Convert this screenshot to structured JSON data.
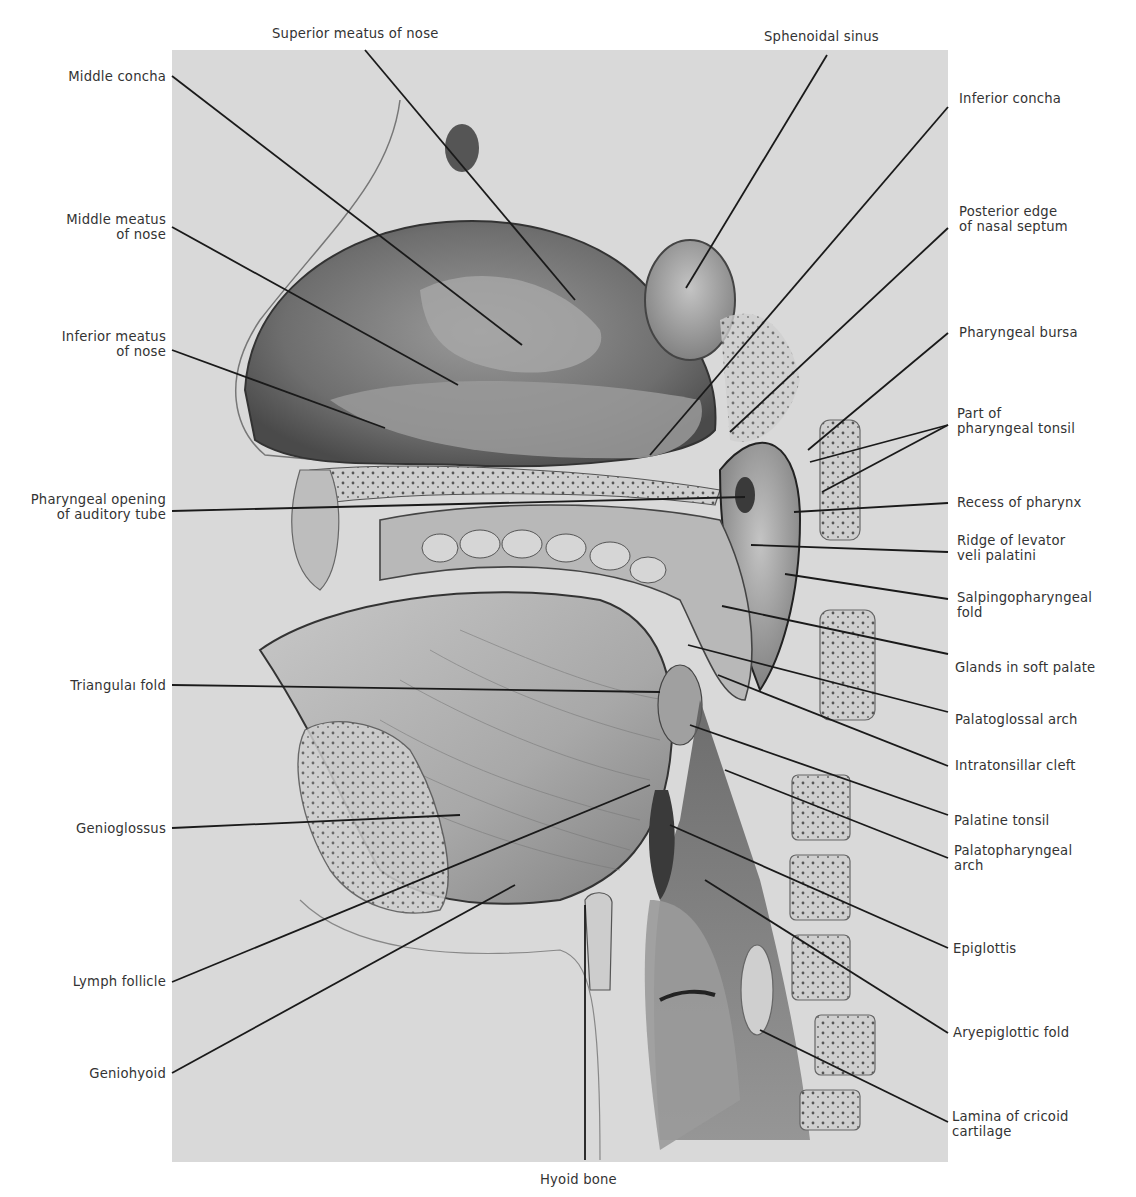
{
  "figure": {
    "colors": {
      "background": "#ffffff",
      "plate": "#d9d9d9",
      "ink": "#1a1a1a",
      "label": "#333333"
    }
  },
  "labels": {
    "top": [
      {
        "id": "superior-meatus",
        "lines": [
          "Superior meatus of nose"
        ]
      },
      {
        "id": "sphenoidal-sinus",
        "lines": [
          "Sphenoidal sinus"
        ]
      }
    ],
    "left": [
      {
        "id": "middle-concha",
        "lines": [
          "Middle concha"
        ]
      },
      {
        "id": "middle-meatus",
        "lines": [
          "Middle meatus",
          "of nose"
        ]
      },
      {
        "id": "inferior-meatus",
        "lines": [
          "Inferior meatus",
          "of nose"
        ]
      },
      {
        "id": "pharyngeal-opening",
        "lines": [
          "Pharyngeal opening",
          "of auditory tube"
        ]
      },
      {
        "id": "triangular-fold",
        "lines": [
          "Triangulaı fold"
        ]
      },
      {
        "id": "genioglossus",
        "lines": [
          "Genioglossus"
        ]
      },
      {
        "id": "lymph-follicle",
        "lines": [
          "Lymph follicle"
        ]
      },
      {
        "id": "geniohyoid",
        "lines": [
          "Geniohyoid"
        ]
      }
    ],
    "right": [
      {
        "id": "inferior-concha",
        "lines": [
          "Inferior concha"
        ]
      },
      {
        "id": "posterior-edge-septum",
        "lines": [
          "Posterior edge",
          "of nasal septum"
        ]
      },
      {
        "id": "pharyngeal-bursa",
        "lines": [
          "Pharyngeal bursa"
        ]
      },
      {
        "id": "pharyngeal-tonsil",
        "lines": [
          "Part of",
          "pharyngeal tonsil"
        ]
      },
      {
        "id": "recess-pharynx",
        "lines": [
          "Recess of pharynx"
        ]
      },
      {
        "id": "ridge-levator",
        "lines": [
          "Ridge of levator",
          "veli palatini"
        ]
      },
      {
        "id": "salpingopharyngeal",
        "lines": [
          "Salpingopharyngeal",
          "fold"
        ]
      },
      {
        "id": "glands-soft-palate",
        "lines": [
          "Glands in soft palate"
        ]
      },
      {
        "id": "palatoglossal-arch",
        "lines": [
          "Palatoglossal arch"
        ]
      },
      {
        "id": "intratonsillar-cleft",
        "lines": [
          "Intratonsillar cleft"
        ]
      },
      {
        "id": "palatine-tonsil",
        "lines": [
          "Palatine tonsil"
        ]
      },
      {
        "id": "palatopharyngeal-arch",
        "lines": [
          "Palatopharyngeal",
          "arch"
        ]
      },
      {
        "id": "epiglottis",
        "lines": [
          "Epiglottis"
        ]
      },
      {
        "id": "aryepiglottic-fold",
        "lines": [
          "Aryepiglottic fold"
        ]
      },
      {
        "id": "lamina-cricoid",
        "lines": [
          "Lamina of cricoid",
          "cartilage"
        ]
      }
    ],
    "bottom": [
      {
        "id": "hyoid-bone",
        "lines": [
          "Hyoid bone"
        ]
      }
    ]
  }
}
